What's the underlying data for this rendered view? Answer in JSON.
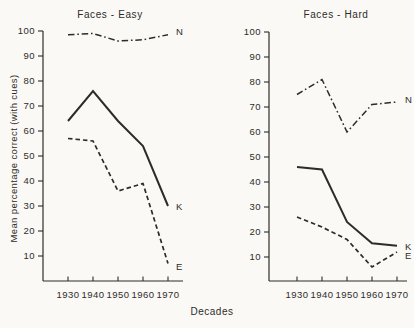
{
  "figure": {
    "background": "#faf9f6",
    "ink": "#2e2c28"
  },
  "ylabel": "Mean percentage correct (with cues)",
  "xlabel": "Decades",
  "chart_data": [
    {
      "type": "line",
      "title": "Faces - Easy",
      "x": [
        1930,
        1940,
        1950,
        1960,
        1970
      ],
      "xlabel": "Decades",
      "ylabel": "Mean percentage correct (with cues)",
      "ylim": [
        0,
        100
      ],
      "yticks": [
        10,
        20,
        30,
        40,
        50,
        60,
        70,
        80,
        90,
        100
      ],
      "grid": false,
      "legend_position": "line-end-labels",
      "series": [
        {
          "name": "N",
          "style": "dashdot",
          "values": [
            98.5,
            99,
            96,
            96.5,
            98.5
          ]
        },
        {
          "name": "K",
          "style": "solid",
          "values": [
            64,
            76,
            64,
            54,
            30
          ]
        },
        {
          "name": "E",
          "style": "dashed",
          "values": [
            57,
            56,
            36,
            39,
            7
          ]
        }
      ]
    },
    {
      "type": "line",
      "title": "Faces - Hard",
      "x": [
        1930,
        1940,
        1950,
        1960,
        1970
      ],
      "xlabel": "Decades",
      "ylabel": "Mean percentage correct (with cues)",
      "ylim": [
        0,
        100
      ],
      "yticks": [
        10,
        20,
        30,
        40,
        50,
        60,
        70,
        80,
        90,
        100
      ],
      "grid": false,
      "legend_position": "line-end-labels",
      "series": [
        {
          "name": "N",
          "style": "dashdot",
          "values": [
            75,
            81,
            60,
            71,
            72
          ]
        },
        {
          "name": "K",
          "style": "solid",
          "values": [
            46,
            45,
            24,
            15.5,
            14.5
          ]
        },
        {
          "name": "E",
          "style": "dashed",
          "values": [
            26,
            22,
            17,
            6,
            12
          ]
        }
      ]
    }
  ]
}
